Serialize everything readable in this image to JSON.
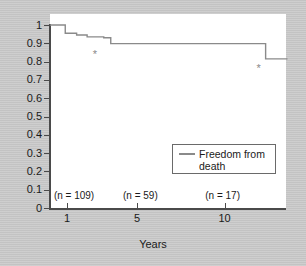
{
  "chart_data": {
    "type": "line",
    "title": "",
    "xlabel": "Years",
    "ylabel": "",
    "xlim": [
      0.03,
      13.6
    ],
    "ylim": [
      0,
      1
    ],
    "grid": false,
    "legend_position": "inside-right",
    "series": [
      {
        "name": "Freedom from death",
        "style": "kaplan-meier-step",
        "color": "#8a8a8a",
        "points": [
          {
            "x": 0.03,
            "y": 1.0
          },
          {
            "x": 0.35,
            "y": 1.0
          },
          {
            "x": 0.9,
            "y": 0.955
          },
          {
            "x": 1.55,
            "y": 0.945
          },
          {
            "x": 2.05,
            "y": 0.945
          },
          {
            "x": 2.15,
            "y": 0.935
          },
          {
            "x": 3.1,
            "y": 0.93
          },
          {
            "x": 3.45,
            "y": 0.93
          },
          {
            "x": 3.5,
            "y": 0.898
          },
          {
            "x": 12.2,
            "y": 0.898
          },
          {
            "x": 12.35,
            "y": 0.815
          },
          {
            "x": 13.6,
            "y": 0.815
          }
        ]
      }
    ],
    "y_ticks": [
      "1",
      "0.9",
      "0.8",
      "0.7",
      "0.6",
      "0.5",
      "0.4",
      "0.3",
      "0.2",
      "0.1",
      "0"
    ],
    "y_tick_values": [
      1,
      0.9,
      0.8,
      0.7,
      0.6,
      0.5,
      0.4,
      0.3,
      0.2,
      0.1,
      0
    ],
    "x_ticks": [
      "1",
      "5",
      "10"
    ],
    "x_tick_values": [
      1,
      5,
      10
    ],
    "censor_marks": [
      {
        "label": "*",
        "x": 2.6,
        "y": 0.855
      },
      {
        "label": "*",
        "x": 11.95,
        "y": 0.775
      }
    ],
    "annotations": [
      {
        "name": "n-at-1-year",
        "text": "(n = 109)",
        "x": 0.25,
        "y": 0.065
      },
      {
        "name": "n-at-5-years",
        "text": "(n = 59)",
        "x": 4.2,
        "y": 0.065
      },
      {
        "name": "n-at-10-years",
        "text": "(n = 17)",
        "x": 8.9,
        "y": 0.065
      }
    ],
    "legend": [
      {
        "label": "Freedom from death",
        "color": "#8a8a8a"
      }
    ]
  },
  "colors": {
    "background": "#c9c9c9",
    "plot_background": "#ffffff",
    "axis": "#4a4a4a",
    "curve": "#8a8a8a",
    "text": "#1a1a1a",
    "censor": "#8a8a8a"
  }
}
